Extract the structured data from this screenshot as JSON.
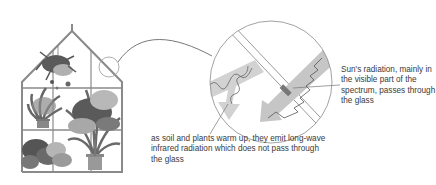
{
  "diagram": {
    "type": "greenhouse-effect-illustration",
    "components": [
      "greenhouse-with-plants",
      "magnifier-circle",
      "glass-pane",
      "sun-radiation-arrow",
      "infrared-radiation-arrow"
    ],
    "labels": {
      "sun_radiation": "Sun's radiation, mainly in the visible part of the spectrum, passes through the glass",
      "infrared": "as soil and plants warm up, they emit long-wave infrared radiation which does not pass through the glass"
    },
    "colors": {
      "frame": "#8a8a8a",
      "arrow_fill": "#c8c8c8",
      "wave_line": "#6a6a6a",
      "text": "#3a3a3a",
      "plant_dark": "#555555",
      "plant_light": "#b5b5b5"
    }
  }
}
